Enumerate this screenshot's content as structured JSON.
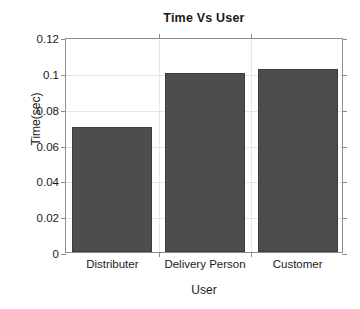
{
  "chart_data": {
    "type": "bar",
    "title": "Time Vs User",
    "xlabel": "User",
    "ylabel": "Time(sec)",
    "categories": [
      "Distributer",
      "Delivery Person",
      "Customer"
    ],
    "values": [
      0.07,
      0.1,
      0.102
    ],
    "ylim": [
      0,
      0.12
    ],
    "xlim": [
      0,
      3
    ],
    "ytick_labels": [
      "0",
      "0.02",
      "0.04",
      "0.06",
      "0.08",
      "0.1",
      "0.12"
    ],
    "ytick_values": [
      0,
      0.02,
      0.04,
      0.06,
      0.08,
      0.1,
      0.12
    ],
    "grid": true,
    "legend": null,
    "bar_color": "#4d4d4d",
    "bar_edge_color": "#3d3d3d",
    "axis_color": "#8c8c8c",
    "grid_color": "#e6e6e6",
    "background": "#ffffff",
    "series": [
      {
        "name": "Time(sec)",
        "values": [
          0.07,
          0.1,
          0.102
        ]
      }
    ]
  }
}
